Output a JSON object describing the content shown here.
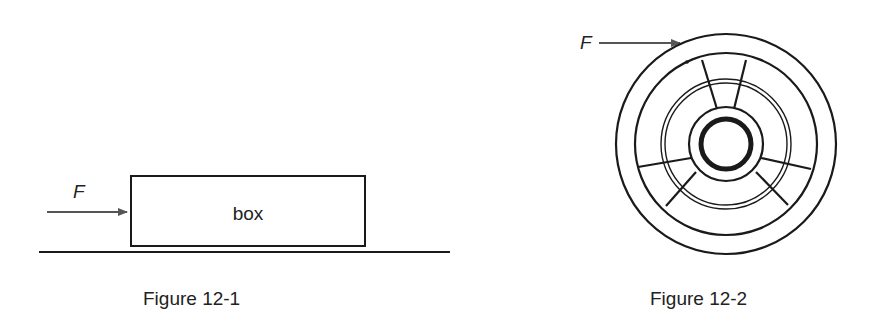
{
  "figures": [
    {
      "caption": "Figure 12-1",
      "force_label": "F",
      "object_label": "box",
      "description": "Horizontal force F pushing a box resting on a flat surface"
    },
    {
      "caption": "Figure 12-2",
      "force_label": "F",
      "description": "Tangential force F applied to the rim of a spoked wheel"
    }
  ],
  "colors": {
    "ink": "#1a1a1a",
    "arrow": "#555555",
    "background": "#ffffff"
  }
}
